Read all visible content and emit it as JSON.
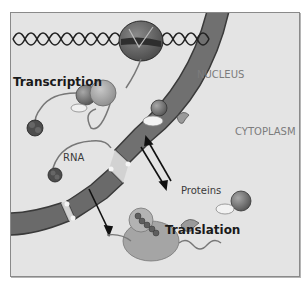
{
  "diagram": {
    "labels": {
      "transcription": "Transcription",
      "nucleus": "NUCLEUS",
      "cytoplasm": "CYTOPLASM",
      "rna": "RNA",
      "proteins": "Proteins",
      "translation": "Translation"
    },
    "regions": [
      "NUCLEUS",
      "CYTOPLASM"
    ],
    "components": [
      "DNA double helix",
      "RNA polymerase",
      "RNA strand",
      "Nuclear envelope",
      "Nuclear pores",
      "Ribosome",
      "Polypeptide chain",
      "Proteins"
    ],
    "flows": [
      {
        "from": "Nucleus",
        "to": "Cytoplasm",
        "item": "RNA",
        "direction": "out"
      },
      {
        "from": "Cytoplasm",
        "to": "Nucleus",
        "item": "Proteins",
        "direction": "in"
      },
      {
        "from": "Nucleus",
        "to": "Cytoplasm",
        "item": "Proteins",
        "direction": "out"
      }
    ],
    "colors": {
      "background": "#e4e4e4",
      "membrane": "#6e6e6e",
      "membrane_outline": "#3a3a3a",
      "text": "#1a1a1a",
      "region_text": "#7c7c7c"
    }
  }
}
